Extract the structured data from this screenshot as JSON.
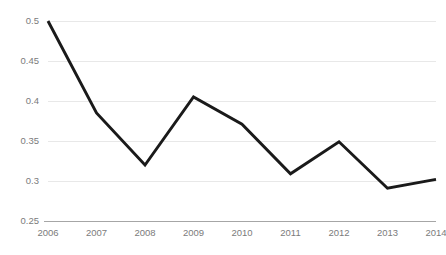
{
  "chart_data": {
    "type": "line",
    "title": "",
    "subtitle": "",
    "xlabel": "",
    "ylabel": "",
    "categories": [
      "2006",
      "2007",
      "2008",
      "2009",
      "2010",
      "2011",
      "2012",
      "2013",
      "2014"
    ],
    "values": [
      0.5,
      0.385,
      0.32,
      0.405,
      0.371,
      0.309,
      0.349,
      0.291,
      0.302
    ],
    "series": [
      {
        "name": "",
        "values": [
          0.5,
          0.385,
          0.32,
          0.405,
          0.371,
          0.309,
          0.349,
          0.291,
          0.302
        ],
        "color": "#1a1a1a"
      }
    ],
    "ylim": [
      0.25,
      0.5
    ],
    "xlim": [
      2006,
      2014
    ],
    "yticks": [
      0.25,
      0.3,
      0.35,
      0.4,
      0.45,
      0.5
    ],
    "ytick_labels": [
      "0.25",
      "0.3",
      "0.35",
      "0.4",
      "0.45",
      "0.5"
    ],
    "xticks": [
      2006,
      2007,
      2008,
      2009,
      2010,
      2011,
      2012,
      2013,
      2014
    ],
    "xtick_labels": [
      "2006",
      "2007",
      "2008",
      "2009",
      "2010",
      "2011",
      "2012",
      "2013",
      "2014"
    ],
    "grid": true,
    "grid_axis": "y",
    "legend": false,
    "legend_position": "none",
    "markers": false,
    "annotations": []
  },
  "style": {
    "background_color": "#ffffff",
    "gridline_color": "#e8e8e8",
    "axis_color": "#a6a6a6",
    "tick_label_color": "#7b7b7b",
    "line_color": "#1a1a1a"
  },
  "layout": {
    "plot_left": 48,
    "plot_right": 436,
    "plot_top": 21,
    "plot_bottom": 221,
    "width": 446,
    "height": 255
  }
}
